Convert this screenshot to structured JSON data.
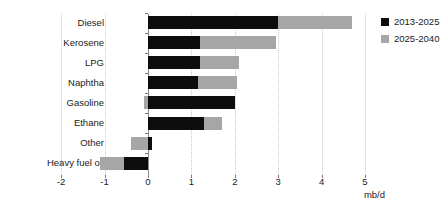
{
  "chart_data": {
    "type": "bar",
    "orientation": "horizontal",
    "stacked": true,
    "title": "",
    "subtitle": "",
    "xlabel": "mb/d",
    "ylabel": "",
    "xlim": [
      -2,
      5
    ],
    "ylim": null,
    "grid": true,
    "grid_axis": "x",
    "legend_position": "top-right",
    "categories": [
      "Diesel",
      "Kerosene",
      "LPG",
      "Naphtha",
      "Gasoline",
      "Ethane",
      "Other",
      "Heavy fuel oil"
    ],
    "xticks": [
      -2,
      -1,
      0,
      1,
      2,
      3,
      4,
      5
    ],
    "xtick_labels": [
      "-2",
      "-1",
      "0",
      "1",
      "2",
      "3",
      "4",
      "5"
    ],
    "series": [
      {
        "name": "2013-2025",
        "color": "#0d0d0d",
        "values": [
          3.0,
          1.2,
          1.2,
          1.15,
          2.0,
          1.3,
          0.1,
          -0.55
        ]
      },
      {
        "name": "2025-2040",
        "color": "#a6a6a6",
        "values": [
          1.7,
          1.75,
          0.9,
          0.9,
          -0.1,
          0.4,
          -0.4,
          -0.55
        ]
      }
    ],
    "totals": [
      4.7,
      2.95,
      2.1,
      2.05,
      1.9,
      1.7,
      -0.3,
      -1.1
    ],
    "annotations": []
  },
  "legend": {
    "items": [
      {
        "label": "2013-2025",
        "color": "#0d0d0d"
      },
      {
        "label": "2025-2040",
        "color": "#a6a6a6"
      }
    ]
  },
  "axis": {
    "unit_label": "mb/d"
  }
}
